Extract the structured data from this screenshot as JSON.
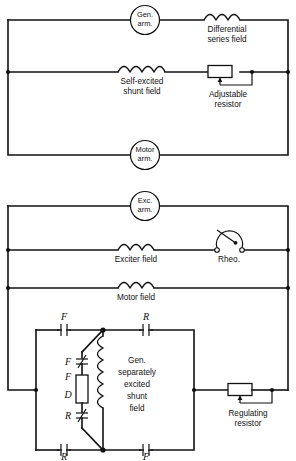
{
  "figure": {
    "type": "electrical-schematic"
  },
  "circuit_top": {
    "name": "top-circuit",
    "machines": [
      {
        "id": "gen-arm",
        "line1": "Gen.",
        "line2": "arm."
      },
      {
        "id": "motor-arm",
        "line1": "Motor",
        "line2": "arm."
      }
    ],
    "coils": [
      {
        "id": "differential-series-field",
        "line1": "Differential",
        "line2": "series field",
        "humps": 3
      },
      {
        "id": "self-excited-shunt-field",
        "line1": "Self-excited",
        "line2": "shunt field",
        "humps": 4
      }
    ],
    "components": [
      {
        "id": "adjustable-resistor",
        "line1": "Adjustable",
        "line2": "resistor",
        "symbol": "rheostat-box-with-tap"
      }
    ]
  },
  "circuit_bottom": {
    "name": "bottom-circuit",
    "machines": [
      {
        "id": "exc-arm",
        "line1": "Exc.",
        "line2": "arm."
      }
    ],
    "coils": [
      {
        "id": "exciter-field",
        "label": "Exciter  field",
        "humps": 3
      },
      {
        "id": "motor-field",
        "label": "Motor field",
        "humps": 3
      },
      {
        "id": "gen-shunt-field",
        "line1": "Gen.",
        "line2": "separately",
        "line3": "excited",
        "line4": "shunt",
        "line5": "field",
        "humps": 3
      }
    ],
    "components": [
      {
        "id": "rheostat",
        "label": "Rheo.",
        "symbol": "arc-rheostat-with-wiper"
      },
      {
        "id": "regulating-resistor",
        "line1": "Regulating",
        "line2": "resistor",
        "symbol": "rheostat-box-with-tap"
      },
      {
        "id": "resistor-fd",
        "labels": [
          "F",
          "D"
        ],
        "symbol": "resistor-box"
      }
    ],
    "contacts": [
      {
        "id": "contact-f-top",
        "label": "F",
        "type": "normally-open",
        "position": "bridge-top-left"
      },
      {
        "id": "contact-r-top",
        "label": "R",
        "type": "normally-open",
        "position": "bridge-top-right"
      },
      {
        "id": "contact-r-bottom",
        "label": "R",
        "type": "normally-open",
        "position": "bridge-bottom-left"
      },
      {
        "id": "contact-f-bottom",
        "label": "F",
        "type": "normally-open",
        "position": "bridge-bottom-right"
      },
      {
        "id": "contact-f-mid",
        "label": "F",
        "type": "normally-closed",
        "position": "center-upper"
      },
      {
        "id": "contact-r-mid",
        "label": "R",
        "type": "normally-closed",
        "position": "center-lower"
      }
    ]
  },
  "colors": {
    "line": "#111111",
    "background": "#ffffff"
  }
}
